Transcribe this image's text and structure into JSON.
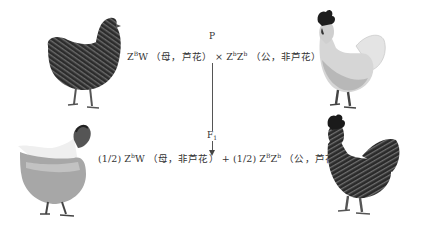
{
  "diagram": {
    "type": "genetic-cross",
    "parent_generation": {
      "label": "P",
      "female": {
        "genotype_base": "Z",
        "genotype_sup1": "B",
        "genotype_rest": "W",
        "phenotype": "（母，芦花）",
        "image": "barred-hen"
      },
      "cross_symbol": "×",
      "male": {
        "genotype_z1": "Z",
        "genotype_sup1": "b",
        "genotype_z2": "Z",
        "genotype_sup2": "b",
        "phenotype": "（公，非芦花）",
        "image": "non-barred-rooster"
      }
    },
    "f1_generation": {
      "label_base": "F",
      "label_sub": "1",
      "offspring": [
        {
          "ratio": "(1/2)",
          "genotype_base": "Z",
          "genotype_sup1": "b",
          "genotype_rest": "W",
          "phenotype": "（母，非芦花）",
          "image": "non-barred-hen"
        },
        {
          "ratio": "(1/2)",
          "genotype_z1": "Z",
          "genotype_sup1": "B",
          "genotype_z2": "Z",
          "genotype_sup2": "b",
          "phenotype": "（公，芦花）",
          "image": "barred-rooster"
        }
      ],
      "plus_symbol": "+"
    }
  },
  "colors": {
    "barred": "#3e3e3e",
    "non_barred": "#d8d8d8",
    "text": "#333333"
  }
}
